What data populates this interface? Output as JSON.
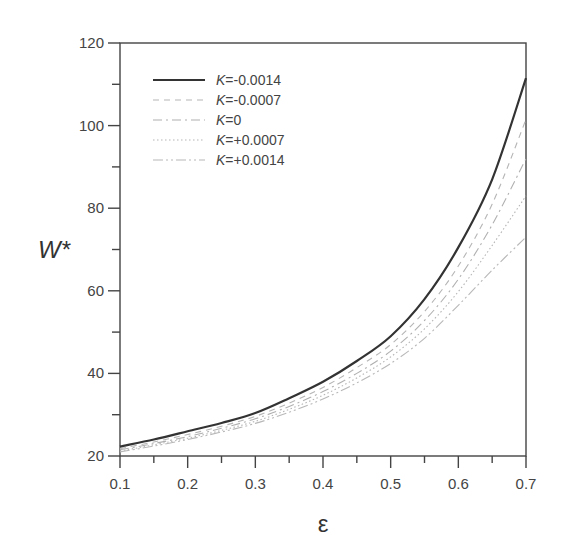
{
  "chart_data": {
    "type": "line",
    "title": "",
    "xlabel": "ε",
    "ylabel": "W*",
    "xlim": [
      0.1,
      0.7
    ],
    "ylim": [
      20,
      120
    ],
    "xticks": [
      0.1,
      0.2,
      0.3,
      0.4,
      0.5,
      0.6,
      0.7
    ],
    "xtick_labels": [
      "0.1",
      "0.2",
      "0.3",
      "0.4",
      "0.5",
      "0.6",
      "0.7"
    ],
    "yticks": [
      20,
      40,
      60,
      80,
      100,
      120
    ],
    "ytick_labels": [
      "20",
      "40",
      "60",
      "80",
      "100",
      "120"
    ],
    "grid": false,
    "legend_position": "upper left",
    "x": [
      0.1,
      0.15,
      0.2,
      0.25,
      0.3,
      0.35,
      0.4,
      0.45,
      0.5,
      0.55,
      0.6,
      0.65,
      0.7
    ],
    "series": [
      {
        "name": "K=-0.0014",
        "k_prefix": "K",
        "k_value": "=-0.0014",
        "style": "solid",
        "color": "#333333",
        "width": 2.2,
        "values": [
          22.3,
          24.0,
          26.0,
          28.0,
          30.4,
          34.0,
          38.0,
          43.0,
          49.0,
          58.0,
          70.5,
          87.0,
          111.5
        ]
      },
      {
        "name": "K=-0.0007",
        "k_prefix": "K",
        "k_value": "=-0.0007",
        "style": "dashed",
        "color": "#b5b5b5",
        "width": 1.1,
        "values": [
          21.8,
          23.4,
          25.2,
          27.2,
          29.6,
          32.8,
          36.6,
          41.4,
          47.0,
          55.0,
          66.0,
          81.0,
          101.5
        ]
      },
      {
        "name": "K=0",
        "k_prefix": "K",
        "k_value": "=0",
        "style": "dashdot-long",
        "color": "#b0b0b0",
        "width": 1.1,
        "values": [
          21.5,
          23.0,
          24.7,
          26.7,
          29.0,
          32.0,
          35.6,
          40.0,
          45.4,
          52.8,
          62.8,
          76.0,
          92.0
        ]
      },
      {
        "name": "K=+0.0007",
        "k_prefix": "K",
        "k_value": "=+0.0007",
        "style": "dotted",
        "color": "#b5b5b5",
        "width": 1.1,
        "values": [
          21.2,
          22.7,
          24.3,
          26.2,
          28.4,
          31.3,
          34.7,
          38.9,
          44.0,
          50.8,
          59.8,
          71.0,
          83.0
        ]
      },
      {
        "name": "K=+0.0014",
        "k_prefix": "K",
        "k_value": "=+0.0014",
        "style": "dashdotdot",
        "color": "#b8b8b8",
        "width": 1.1,
        "values": [
          21.0,
          22.4,
          24.0,
          25.8,
          27.9,
          30.6,
          33.8,
          37.7,
          42.4,
          48.5,
          56.5,
          65.0,
          73.0
        ]
      }
    ]
  }
}
